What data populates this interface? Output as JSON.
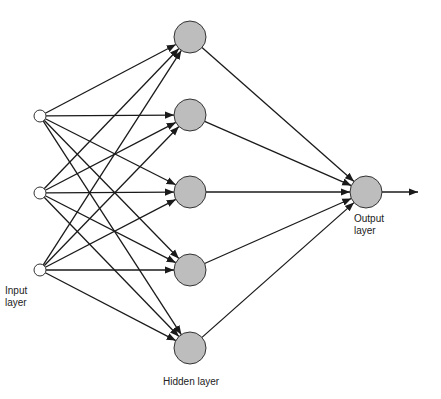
{
  "diagram": {
    "colors": {
      "hidden_fill": "#bdbdbd",
      "output_fill": "#bdbdbd",
      "input_fill": "#ffffff",
      "stroke": "#1a1a1a"
    },
    "layers": {
      "input": {
        "label_line1": "Input",
        "label_line2": "layer",
        "nodes": [
          {
            "x": 40,
            "y": 116
          },
          {
            "x": 40,
            "y": 193
          },
          {
            "x": 40,
            "y": 270
          }
        ],
        "radius": 6
      },
      "hidden": {
        "label": "Hidden layer",
        "nodes": [
          {
            "x": 190,
            "y": 37
          },
          {
            "x": 190,
            "y": 115
          },
          {
            "x": 190,
            "y": 192
          },
          {
            "x": 190,
            "y": 270
          },
          {
            "x": 190,
            "y": 348
          }
        ],
        "radius": 16
      },
      "output": {
        "label_line1": "Output",
        "label_line2": "layer",
        "nodes": [
          {
            "x": 366,
            "y": 192
          }
        ],
        "radius": 16
      }
    },
    "connections": "fully connected input→hidden, hidden→output, output→external arrow"
  }
}
